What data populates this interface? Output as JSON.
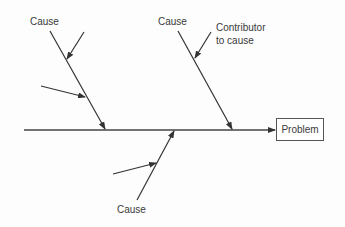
{
  "diagram": {
    "type": "fishbone",
    "effect": {
      "label": "Problem"
    },
    "spine": {
      "x1": 24,
      "y1": 130,
      "x2": 274,
      "y2": 130
    },
    "causes": [
      {
        "id": "top-left",
        "label": "Cause",
        "line": [
          50,
          31,
          105,
          129
        ],
        "contributors": [
          {
            "line": [
              84,
              32,
              67,
              59
            ]
          },
          {
            "line": [
              41,
              86,
              85,
              97
            ]
          }
        ]
      },
      {
        "id": "top-right",
        "label": "Cause",
        "line": [
          178,
          31,
          232,
          129
        ],
        "contributors": [
          {
            "label": "Contributor to cause",
            "line": [
              211,
              32,
              195,
              58
            ]
          }
        ]
      },
      {
        "id": "bottom",
        "label": "Cause",
        "line": [
          137,
          200,
          174,
          131
        ],
        "contributors": [
          {
            "line": [
              113,
              174,
              156,
              163
            ]
          }
        ]
      }
    ],
    "labels": {
      "cause_top_left": "Cause",
      "cause_top_right": "Cause",
      "cause_bottom": "Cause",
      "contributor_line1": "Contributor",
      "contributor_line2": "to cause",
      "problem": "Problem"
    },
    "colors": {
      "line": "#333333",
      "text": "#3a3a3a",
      "box_border": "#555555"
    }
  }
}
